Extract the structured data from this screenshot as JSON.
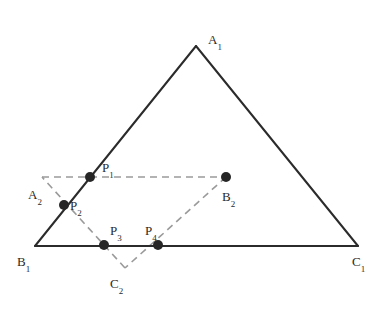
{
  "figure": {
    "canvas": {
      "width": 384,
      "height": 310,
      "background": "#ffffff"
    },
    "style": {
      "solid_stroke_color": "#2b2b2b",
      "solid_stroke_width": 2,
      "dashed_stroke_color": "#9a9a9a",
      "dashed_stroke_width": 1.6,
      "dash_pattern": "7,5",
      "point_fill_color": "#262626",
      "point_radius": 5,
      "label_color": "#2b2b2b"
    },
    "triangles": [
      {
        "name": "triangle-1",
        "style": "solid",
        "vertices": [
          {
            "id": "A1",
            "label": "A",
            "sub": "1",
            "x": 196,
            "y": 46,
            "label_x": 208,
            "label_y": 33
          },
          {
            "id": "B1",
            "label": "B",
            "sub": "1",
            "x": 35,
            "y": 246,
            "label_x": 17,
            "label_y": 255
          },
          {
            "id": "C1",
            "label": "C",
            "sub": "1",
            "x": 358,
            "y": 246,
            "label_x": 352,
            "label_y": 255
          }
        ]
      },
      {
        "name": "triangle-2",
        "style": "dashed",
        "vertices": [
          {
            "id": "A2",
            "label": "A",
            "sub": "2",
            "x": 42,
            "y": 177,
            "label_x": 28,
            "label_y": 188
          },
          {
            "id": "B2",
            "label": "B",
            "sub": "2",
            "x": 226,
            "y": 177,
            "label_x": 222,
            "label_y": 190
          },
          {
            "id": "C2",
            "label": "C",
            "sub": "2",
            "x": 125,
            "y": 268,
            "label_x": 110,
            "label_y": 277
          }
        ]
      }
    ],
    "intersection_points": [
      {
        "id": "P1",
        "label": "P",
        "sub": "1",
        "x": 90,
        "y": 177,
        "label_x": 102,
        "label_y": 161,
        "on_edges": "A1B1 x A2B2"
      },
      {
        "id": "P2",
        "label": "P",
        "sub": "2",
        "x": 64,
        "y": 205,
        "label_x": 70,
        "label_y": 199,
        "on_edges": "A1B1 x A2C2"
      },
      {
        "id": "P3",
        "label": "P",
        "sub": "3",
        "x": 104,
        "y": 245,
        "label_x": 110,
        "label_y": 224,
        "on_edges": "B1C1 x A2C2"
      },
      {
        "id": "P4",
        "label": "P",
        "sub": "4",
        "x": 158,
        "y": 245,
        "label_x": 145,
        "label_y": 224,
        "on_edges": "B1C1 x B2C2"
      }
    ]
  }
}
